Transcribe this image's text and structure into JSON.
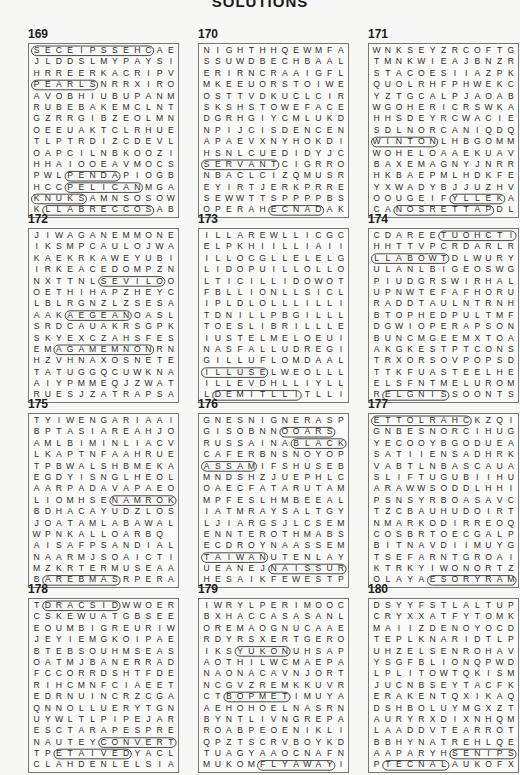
{
  "page": {
    "title": "SOLUTIONS"
  },
  "puzzles": [
    {
      "number": "169",
      "grid": [
        "SECEIPSSEHCAE",
        "JLDDSLMYPAYSI",
        "HRREERKACRIPV",
        "PEARLSNRRXIRO",
        "AVOBHIUBUPANM",
        "RUBEBAKEMCLNT",
        "GZRRGIBZEOLMN",
        "OEEUAKTCLRHUE",
        "TLPTRDIZCDEVL",
        "OAPCILNBKOOZI",
        "HHAIOOEAVMOCS",
        "PWLPENDAPIOGB",
        "HCCPELICANMGA",
        "KNUKSAMNSOSOW",
        "KLLABRECCOSAB"
      ],
      "words": [
        "SECEIPSSEHC",
        "PEARLS",
        "PELICAN",
        "KNUKS",
        "LLABRECCOS",
        "PENDA"
      ]
    },
    {
      "number": "170",
      "grid": [
        "NIGHTHHQEWMFA",
        "SSUWDBECHBAAL",
        "ERIRNCRAAIGFL",
        "MKEEUORSTOIWE",
        "OSTTVDKUCLCIR",
        "SKSHSTOWEFACE",
        "DGRHGIYCMLUKD",
        "NPIJCISDENCEN",
        "APAEVXNYHOKDI",
        "HSNLCUEDIDYJC",
        "SERVANTCIGRRO",
        "NBACLCIZQMUSR",
        "EYIRTJERKPRRE",
        "SEWWTTSPPPPBS",
        "OPERAHECNADAK"
      ],
      "words": [
        "SERVANT",
        "ECNAD",
        "ALLERGENIC",
        "WICKED"
      ]
    },
    {
      "number": "171",
      "grid": [
        "WNKSEYZRCOFTG",
        "TMNKWIEAJBNZR",
        "STACOESIIAZPK",
        "QUOLRHFPHWEKC",
        "YZTGCALPJAOAB",
        "WGOHERICRSWKA",
        "HHSDEYRCWACIE",
        "SDLNORCANIQDQ",
        "WINTONLHBGOMM",
        "WOHELOAAEKUAV",
        "BAXEMAGNYJNRR",
        "HKBAEPMLHDKFE",
        "YXWADYBJJUZHV",
        "OOUGEIFYLLEKA",
        "CANOSRETTAPDL"
      ],
      "words": [
        "WINTON",
        "YLLEK",
        "NOSRETTAP",
        "KIDMAN",
        "REVAL"
      ]
    },
    {
      "number": "172",
      "grid": [
        "JIWAGANEMMONE",
        "IKSMPCAULOJWA",
        "KAEKRKAWEYUBI",
        "IRKEACEDOMPZN",
        "NXTTNLSEVILOO",
        "OETHIHAPZHEYC",
        "LBLRGNZLZSESA",
        "AAKAEGEANOASL",
        "SRDCAUAKRSGPK",
        "SKYEXCZAHSFES",
        "EMAGAMEMNONRN",
        "HZVHNAXOSNETE",
        "TATUGGQCUWKNAH",
        "AIYPMMEQJZWAT",
        "RUESJZATRAPSA"
      ],
      "words": [
        "AGAMEMNON",
        "AEGEAN",
        "SEVILO",
        "SPARTA",
        "NIKOLAS",
        "ATHENS"
      ]
    },
    {
      "number": "173",
      "grid": [
        "ILLAREWLLICGC",
        "ELPKHIILLIAII",
        "ILLOCGLLELELG",
        "LIDOPUILLOLLO",
        "LTICILLIDOWOTL",
        "FBLLIONLLSICL",
        "IPLDLOLLLILLI",
        "TDNILLPBGILLL",
        "TOESLIBRILLLE",
        "IUSTELMELOEUI",
        "NASFALLUDREGID",
        "GILLUFLOMDAALE",
        "ILLUSELWEOLLL",
        "ILLEVDHLLIYLL",
        "LDEMITLLITLLI"
      ],
      "words": [
        "ILLUSE",
        "DEMITLLI",
        "CIGOLLI",
        "ILLFITTING"
      ]
    },
    {
      "number": "174",
      "grid": [
        "CDAREETUOHCTIP",
        "HHTTVPCRDARLR",
        "LLABOWTDLWURY",
        "ULANLBIGEOSWG",
        "PIUDGRSWIRHAL",
        "UPNWTEFAFHORU",
        "RADDTAULNTRNH",
        "BTOPHEDPULTMF",
        "DGWIOPERAPSON",
        "BUNCMGEEMXTOA",
        "AKGKESTPTCONS",
        "TRXORSOVPOPSD",
        "TTKFUASTEELHE",
        "ELSFNTMELUROM",
        "RELGNISSOONTS"
      ],
      "words": [
        "TUOHCTIP",
        "LLABOWT",
        "ELGNIS",
        "TRAPSHOOT",
        "DOUBLEPLAY"
      ]
    },
    {
      "number": "175",
      "grid": [
        "TYIWENGARIAAI",
        "BPTASIAREAHJO",
        "AMLBIMINLIACV",
        "LKAPTNFAAHRUE",
        "TPBWALSHBMEKA",
        "EGDYISNGLHEOL",
        "AARPADAVAPAEO",
        "LIOMHSENAMROK",
        "BDHACAYUDZLOS",
        "JOATAMLABAWAL",
        "WPNKALLOARBQ",
        "AISAFPSANDIAL",
        "NAARMJSOAICTI",
        "MZKRTERMUSEAA",
        "BAREBMASRPERA"
      ],
      "words": [
        "NAMROK",
        "AREBMAS",
        "ABALONE",
        "SMARTH"
      ]
    },
    {
      "number": "176",
      "grid": [
        "GNESNIGNERASP",
        "GISOBNNOOARS",
        "RUSSAINABLACK",
        "CAFERBNSNOYOP",
        "ASSAMIFSHUSEB",
        "MNDSHZJUEPHLC",
        "OAECFATARUTAM",
        "MPFESLHMBEEAL",
        "IATMRAYSALTGY",
        "LJIARGSJLCSEM",
        "ENNTEROTHMABS",
        "ECDROYNAASSEM",
        "TAIWANUTENLAY",
        "UEANEJNAISSUR",
        "HESAIKFEWESTP"
      ],
      "words": [
        "TAIWAN",
        "NAISSUR",
        "BLACK",
        "OOARS",
        "ASSAM",
        "CAMOMILE"
      ]
    },
    {
      "number": "177",
      "grid": [
        "ETTOLRAHCKZQI",
        "GNBESNORCIHUG",
        "YECOOYBGODUEA",
        "SATIIENSADHRK",
        "VABTLNBASCAUA",
        "SLIFTUGUBIIHU",
        "ARAWWSODDLHHI",
        "PSNSYRBOASAVC",
        "TZCBAUHUDOIRT",
        "NMARKODIRREOQ",
        "COSBRTOECGALP",
        "BITNAVDIIMUYG",
        "TSEFARNTGROAI",
        "KTRKYIWONORTZ",
        "OLAYAESORYRAM"
      ],
      "words": [
        "ETTOLRAHC",
        "ESORYRAM",
        "IGAKA"
      ]
    },
    {
      "number": "178",
      "grid": [
        "TDRACSIDWWOER",
        "CSKEWUATGBSEE",
        "EOUMBIGREURIW",
        "JEYIEMGKOIPAE",
        "BTEBSOUHMSEAS",
        "OATMJBANERRAD",
        "FCCORRDSHTFDE",
        "RIHCMNFCIAEET",
        "EDRNUINCRZCGA",
        "QNNOLLUERYTGN",
        "UYWLTLPIPEJAR",
        "ESCTARAPESPRE",
        "NAUTEYCONVERT",
        "TPETAIVEDYACL",
        "CLAHDENLELSIA"
      ],
      "words": [
        "DRACSID",
        "CONVERT",
        "ETAIVED",
        "ETARAPES",
        "FREQUENT"
      ]
    },
    {
      "number": "179",
      "grid": [
        "IWRYLPERIMOOC",
        "BXHACCASASANL",
        "OREMAOGNUCAAE",
        "RDYRSXERTGERO",
        "IKSYUKONUHSAP",
        "AOTHILWCMAEPA",
        "NAONACAVNJORT",
        "NCGVZREMKKUVR",
        "CTBOPMETIMUYA",
        "AEHOHOELNASRN",
        "BYNTLIVNGREPA",
        "ROABPEOENIKLI",
        "QPZTSCRVBOYKD",
        "TUAGYAAOCNAFN",
        "MUKOMFLYAWAYI"
      ],
      "words": [
        "FLYAWAY",
        "BOPMET",
        "YUKON",
        "CLEOPATRA",
        "ANAIDNI"
      ]
    },
    {
      "number": "180",
      "grid": [
        "DSYYFSTLALTUP",
        "CRYXXATFYTOMK",
        "MAIIZDENOYOCD",
        "TEPLKNARIDTLP",
        "UHZELSENROHAV",
        "YSGFBLIONQPWD",
        "LPLITOWTQKISM",
        "JUCNBSEYTACFK",
        "ERAKENTQXIKAQ",
        "DSHBOLUYMGXZT",
        "AURYRXDIXNHQM",
        "LAADDVTEARROT",
        "BBHYNATREHLQE",
        "AAPARYHSENIPS",
        "PTECNALAUKOFX"
      ],
      "words": [
        "SENIPS",
        "TECNAL",
        "DRAPES"
      ]
    }
  ]
}
